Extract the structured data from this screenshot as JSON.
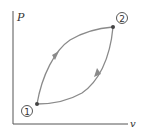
{
  "diagram": {
    "type": "P-v cycle diagram",
    "y_axis_label": "P",
    "x_axis_label": "v",
    "points": [
      {
        "id": "1",
        "label": "1",
        "x": 37,
        "y": 104
      },
      {
        "id": "2",
        "label": "2",
        "x": 113,
        "y": 27
      }
    ],
    "paths": [
      {
        "name": "upper-path",
        "from": "1",
        "to": "2",
        "direction": "1 to 2"
      },
      {
        "name": "lower-path",
        "from": "2",
        "to": "1",
        "direction": "2 to 1"
      }
    ],
    "colors": {
      "axis": "#555555",
      "curve": "#8a8a8a",
      "point": "#444444",
      "text": "#333333"
    }
  }
}
